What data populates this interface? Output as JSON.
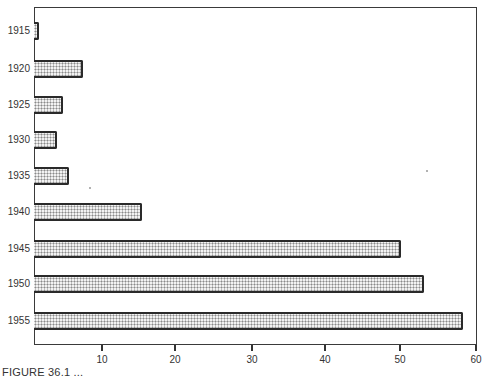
{
  "chart_data": {
    "type": "bar",
    "orientation": "horizontal",
    "title": "",
    "xlabel": "",
    "ylabel": "",
    "categories": [
      "1915",
      "1920",
      "1925",
      "1930",
      "1935",
      "1940",
      "1945",
      "1950",
      "1955"
    ],
    "values": [
      1.7,
      7.6,
      4.9,
      4.1,
      5.7,
      15.5,
      50.1,
      53.2,
      58.4
    ],
    "xlim": [
      0,
      60
    ],
    "xticks": [
      "10",
      "20",
      "30",
      "40",
      "50",
      "60"
    ],
    "grid": false,
    "legend": null,
    "fill": "stippled gray dot pattern",
    "caption": "FIGURE 36.1 (text truncated at bottom of image)"
  },
  "labels": {
    "y": [
      "1915",
      "1920",
      "1925",
      "1930",
      "1935",
      "1940",
      "1945",
      "1950",
      "1955"
    ],
    "x": [
      "10",
      "20",
      "30",
      "40",
      "50",
      "60"
    ],
    "caption": "FIGURE 36.1 ..."
  },
  "colors": {
    "bar_border": "#2a2a2a",
    "bar_fill": "#f2f2f2",
    "bar_dots": "#8a8a8a",
    "frame": "#3a3a3a"
  }
}
